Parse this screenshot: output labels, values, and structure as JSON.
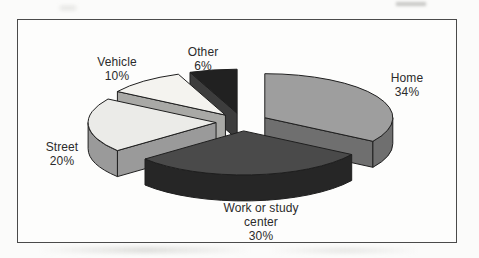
{
  "chart_data": {
    "type": "pie",
    "style": "3d-exploded",
    "title": "",
    "legend": "none",
    "labels_on_chart": true,
    "label_format": "name + percent",
    "slices": [
      {
        "label": "Home",
        "value": 34,
        "pct_label": "34%",
        "top_color": "#9e9e9e",
        "side_color": "#6f6f6f"
      },
      {
        "label": "Work or study center",
        "value": 30,
        "pct_label": "30%",
        "top_color": "#4a4a4a",
        "side_color": "#262626"
      },
      {
        "label": "Street",
        "value": 20,
        "pct_label": "20%",
        "top_color": "#ebebe8",
        "side_color": "#9a9a9a"
      },
      {
        "label": "Vehicle",
        "value": 10,
        "pct_label": "10%",
        "top_color": "#f4f3ef",
        "side_color": "#a9a9a6"
      },
      {
        "label": "Other",
        "value": 6,
        "pct_label": "6%",
        "top_color": "#212121",
        "side_color": "#3d3d3d"
      }
    ]
  },
  "frame": {
    "border_color": "#4a4a4a",
    "background": "#fdfdfc",
    "outline_color": "#1f1f1f"
  }
}
